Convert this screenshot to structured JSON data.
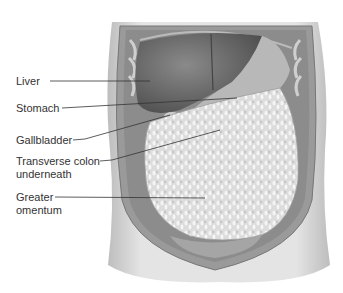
{
  "figure": {
    "labels": [
      {
        "id": "liver",
        "lines": [
          "Liver"
        ],
        "x": 16,
        "y": 75,
        "line_from": [
          50,
          81
        ],
        "line_to": [
          150,
          81
        ]
      },
      {
        "id": "stomach",
        "lines": [
          "Stomach"
        ],
        "x": 16,
        "y": 102,
        "line_from": [
          62,
          108
        ],
        "line_to": [
          237,
          98
        ]
      },
      {
        "id": "gallbladder",
        "lines": [
          "Gallbladder"
        ],
        "x": 16,
        "y": 134,
        "line_from": [
          73,
          140
        ],
        "line_to": [
          170,
          115
        ]
      },
      {
        "id": "transverse-colon",
        "lines": [
          "Transverse colon",
          "underneath"
        ],
        "x": 16,
        "y": 155,
        "line_from": [
          100,
          161
        ],
        "line_to": [
          220,
          130
        ]
      },
      {
        "id": "greater-omentum",
        "lines": [
          "Greater",
          "omentum"
        ],
        "x": 16,
        "y": 191,
        "line_from": [
          55,
          197
        ],
        "line_to": [
          205,
          198
        ]
      }
    ]
  },
  "colors": {
    "label_text": "#333333",
    "leader_line": "#333333",
    "background": "#ffffff",
    "skin": "#d9d9d9",
    "liver": "#6e6e6e",
    "stomach": "#b3b3b3",
    "omentum": "#e6e6e6"
  }
}
